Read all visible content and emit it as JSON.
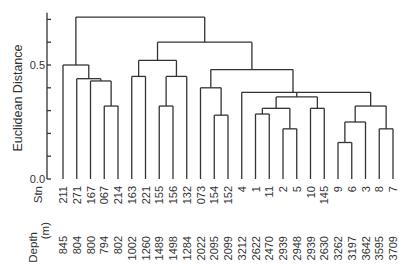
{
  "chart_data": {
    "type": "dendrogram",
    "title": "",
    "ylabel": "Euclidean Distance",
    "ylim": [
      0.0,
      0.72
    ],
    "yticks": [
      0.0,
      0.1,
      0.2,
      0.3,
      0.4,
      0.5,
      0.6,
      0.7
    ],
    "ytick_labels": {
      "0.0": "0.0",
      "0.5": "0.5"
    },
    "row_labels": {
      "stn": "Stn",
      "depth": "Depth\n(m)"
    },
    "leaves": [
      {
        "stn": "211",
        "depth": "845"
      },
      {
        "stn": "271",
        "depth": "804"
      },
      {
        "stn": "167",
        "depth": "800"
      },
      {
        "stn": "067",
        "depth": "794"
      },
      {
        "stn": "214",
        "depth": "802"
      },
      {
        "stn": "163",
        "depth": "1002"
      },
      {
        "stn": "221",
        "depth": "1260"
      },
      {
        "stn": "155",
        "depth": "1489"
      },
      {
        "stn": "156",
        "depth": "1498"
      },
      {
        "stn": "132",
        "depth": "1284"
      },
      {
        "stn": "073",
        "depth": "2022"
      },
      {
        "stn": "154",
        "depth": "2095"
      },
      {
        "stn": "152",
        "depth": "2099"
      },
      {
        "stn": "4",
        "depth": "3212"
      },
      {
        "stn": "1",
        "depth": "2622"
      },
      {
        "stn": "11",
        "depth": "2470"
      },
      {
        "stn": "2",
        "depth": "2939"
      },
      {
        "stn": "5",
        "depth": "2948"
      },
      {
        "stn": "10",
        "depth": "2939"
      },
      {
        "stn": "145",
        "depth": "2630"
      },
      {
        "stn": "9",
        "depth": "3262"
      },
      {
        "stn": "6",
        "depth": "3197"
      },
      {
        "stn": "3",
        "depth": "3642"
      },
      {
        "stn": "8",
        "depth": "3595"
      },
      {
        "stn": "7",
        "depth": "3709"
      }
    ],
    "merges": [
      {
        "id": "A",
        "children": [
          "067",
          "214"
        ],
        "height": 0.32
      },
      {
        "id": "B",
        "children": [
          "167",
          "A"
        ],
        "height": 0.43
      },
      {
        "id": "C",
        "children": [
          "271",
          "B"
        ],
        "height": 0.44
      },
      {
        "id": "D",
        "children": [
          "211",
          "C"
        ],
        "height": 0.5
      },
      {
        "id": "E",
        "children": [
          "163",
          "221"
        ],
        "height": 0.45
      },
      {
        "id": "F",
        "children": [
          "155",
          "156"
        ],
        "height": 0.32
      },
      {
        "id": "G",
        "children": [
          "F",
          "132"
        ],
        "height": 0.45
      },
      {
        "id": "H",
        "children": [
          "E",
          "G"
        ],
        "height": 0.52
      },
      {
        "id": "I",
        "children": [
          "154",
          "152"
        ],
        "height": 0.28
      },
      {
        "id": "J",
        "children": [
          "073",
          "I"
        ],
        "height": 0.4
      },
      {
        "id": "K",
        "children": [
          "1",
          "11"
        ],
        "height": 0.285
      },
      {
        "id": "L",
        "children": [
          "2",
          "5"
        ],
        "height": 0.22
      },
      {
        "id": "M",
        "children": [
          "K",
          "L"
        ],
        "height": 0.31
      },
      {
        "id": "N",
        "children": [
          "10",
          "145"
        ],
        "height": 0.31
      },
      {
        "id": "O",
        "children": [
          "M",
          "N"
        ],
        "height": 0.36
      },
      {
        "id": "P",
        "children": [
          "9",
          "6"
        ],
        "height": 0.16
      },
      {
        "id": "Q",
        "children": [
          "P",
          "3"
        ],
        "height": 0.25
      },
      {
        "id": "R",
        "children": [
          "8",
          "7"
        ],
        "height": 0.22
      },
      {
        "id": "S",
        "children": [
          "Q",
          "R"
        ],
        "height": 0.32
      },
      {
        "id": "T",
        "children": [
          "4",
          "O",
          "S"
        ],
        "height": 0.38
      },
      {
        "id": "U",
        "children": [
          "J",
          "T"
        ],
        "height": 0.48
      },
      {
        "id": "V",
        "children": [
          "H",
          "U"
        ],
        "height": 0.6
      },
      {
        "id": "W",
        "children": [
          "D",
          "V"
        ],
        "height": 0.71
      }
    ]
  }
}
